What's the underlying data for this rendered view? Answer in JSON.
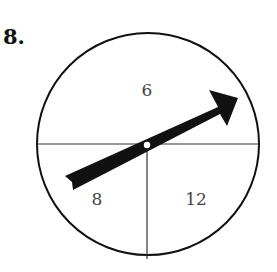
{
  "problem": {
    "number": "8."
  },
  "spinner": {
    "sections": [
      {
        "label": "6",
        "position": "top half"
      },
      {
        "label": "8",
        "position": "bottom-left quarter"
      },
      {
        "label": "12",
        "position": "bottom-right quarter"
      }
    ],
    "arrow": {
      "pointing": "upper-right",
      "region": "6"
    }
  }
}
